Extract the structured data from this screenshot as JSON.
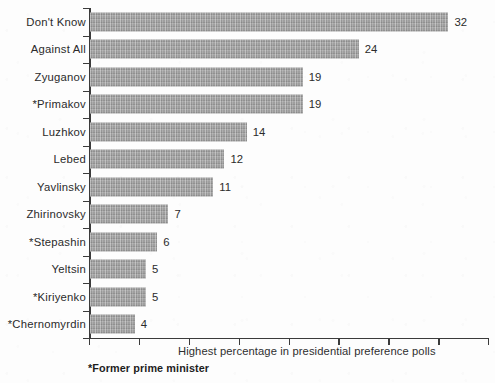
{
  "chart_data": {
    "type": "bar",
    "orientation": "horizontal",
    "title": "",
    "xlabel": "Highest percentage in presidential preference polls",
    "ylabel": "",
    "categories": [
      "Don't Know",
      "Against All",
      "Zyuganov",
      "*Primakov",
      "Luzhkov",
      "Lebed",
      "Yavlinsky",
      "Zhirinovsky",
      "*Stepashin",
      "Yeltsin",
      "*Kiriyenko",
      "*Chernomyrdin"
    ],
    "values": [
      32,
      24,
      19,
      19,
      14,
      12,
      11,
      7,
      6,
      5,
      5,
      4
    ],
    "value_labels": [
      "32",
      "24",
      "19",
      "19",
      "14",
      "12",
      "11",
      "7",
      "6",
      "5",
      "5",
      "4"
    ],
    "xlim": [
      0,
      35
    ],
    "x_tick_count": 8,
    "x_tick_labels": [],
    "grid": false,
    "legend": null,
    "bar_color": "#9c9c9c",
    "axis_color": "#3b3b3b",
    "text_color": "#2b2b2b",
    "background_color": "#fdfdfd",
    "footnote": "*Former prime minister"
  }
}
